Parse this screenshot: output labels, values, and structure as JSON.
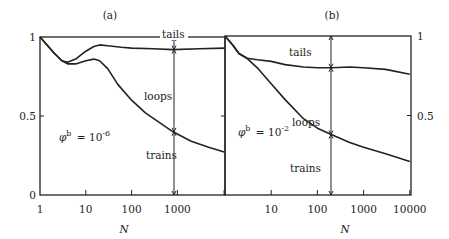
{
  "chart_data": [
    {
      "type": "line",
      "panel_label": "(a)",
      "xlabel": "N",
      "ylabel": "",
      "x_scale": "log",
      "xlim": [
        1,
        11000
      ],
      "ylim": [
        0,
        1
      ],
      "x_ticks": [
        1,
        10,
        100,
        1000
      ],
      "x_tick_labels": [
        "1",
        "10",
        "100",
        "1000"
      ],
      "y_ticks": [
        0,
        0.5,
        1
      ],
      "y_tick_labels": [
        "0",
        "0.5",
        "1"
      ],
      "annotation": "φ^b = 10^-6",
      "annotation_base": "φ",
      "annotation_sup": "b",
      "annotation_eq": "= 10",
      "annotation_exp": "-6",
      "region_labels": [
        "tails",
        "loops",
        "trains"
      ],
      "marker_N": 800,
      "series": [
        {
          "name": "tails/loops boundary",
          "x": [
            1,
            2,
            3,
            4,
            6,
            10,
            15,
            20,
            30,
            60,
            100,
            300,
            800,
            3000,
            11000
          ],
          "y": [
            1.0,
            0.9,
            0.85,
            0.84,
            0.86,
            0.91,
            0.94,
            0.95,
            0.945,
            0.935,
            0.93,
            0.925,
            0.92,
            0.925,
            0.93
          ]
        },
        {
          "name": "loops/trains boundary",
          "x": [
            1,
            2,
            3,
            4,
            6,
            10,
            15,
            20,
            30,
            50,
            100,
            200,
            400,
            800,
            2000,
            5000,
            11000
          ],
          "y": [
            1.0,
            0.9,
            0.85,
            0.83,
            0.83,
            0.85,
            0.86,
            0.85,
            0.8,
            0.7,
            0.6,
            0.52,
            0.46,
            0.4,
            0.34,
            0.3,
            0.27
          ]
        }
      ]
    },
    {
      "type": "line",
      "panel_label": "(b)",
      "xlabel": "N",
      "ylabel": "",
      "x_scale": "log",
      "xlim": [
        1,
        10000
      ],
      "ylim": [
        0,
        1
      ],
      "x_ticks": [
        10,
        100,
        1000,
        10000
      ],
      "x_tick_labels": [
        "10",
        "100",
        "1000",
        "10000"
      ],
      "y_ticks": [
        0.5,
        1
      ],
      "y_tick_labels": [
        "0.5",
        "1"
      ],
      "annotation": "φ^b = 10^-2",
      "annotation_base": "φ",
      "annotation_sup": "b",
      "annotation_eq": "= 10",
      "annotation_exp": "-2",
      "region_labels": [
        "tails",
        "loops",
        "trains"
      ],
      "marker_N": 200,
      "series": [
        {
          "name": "tails/loops boundary",
          "x": [
            1,
            1.5,
            2,
            3,
            5,
            10,
            20,
            50,
            100,
            200,
            500,
            1000,
            3000,
            10000
          ],
          "y": [
            1.0,
            0.94,
            0.89,
            0.86,
            0.85,
            0.84,
            0.82,
            0.805,
            0.8,
            0.8,
            0.805,
            0.8,
            0.79,
            0.76
          ]
        },
        {
          "name": "loops/trains boundary",
          "x": [
            1,
            1.5,
            2,
            3,
            5,
            10,
            20,
            50,
            100,
            200,
            500,
            1000,
            3000,
            10000
          ],
          "y": [
            1.0,
            0.94,
            0.89,
            0.86,
            0.8,
            0.7,
            0.6,
            0.48,
            0.42,
            0.38,
            0.33,
            0.3,
            0.26,
            0.21
          ]
        }
      ]
    }
  ]
}
